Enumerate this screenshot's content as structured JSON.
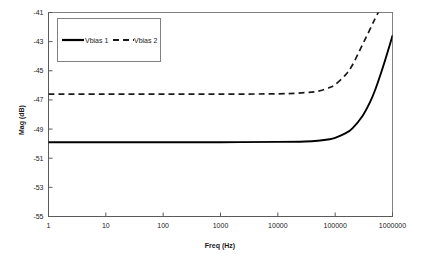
{
  "chart_data": {
    "type": "line",
    "title": "",
    "xlabel": "Freq (Hz)",
    "ylabel": "Mag (dB)",
    "xscale": "log",
    "xlim": [
      1,
      1000000
    ],
    "ylim": [
      -55,
      -41
    ],
    "grid": false,
    "legend_position": "top-left",
    "xticks": [
      "1",
      "10",
      "100",
      "1000",
      "10000",
      "100000",
      "1000000"
    ],
    "xtick_values": [
      1,
      10,
      100,
      1000,
      10000,
      100000,
      1000000
    ],
    "yticks": [
      "-41",
      "-43",
      "-45",
      "-47",
      "-49",
      "-51",
      "-53",
      "-55"
    ],
    "ytick_values": [
      -41,
      -43,
      -45,
      -47,
      -49,
      -51,
      -53,
      -55
    ],
    "series": [
      {
        "name": "Vbias 1",
        "style": "solid",
        "color": "#000000",
        "x": [
          1,
          10,
          100,
          1000,
          10000,
          30000,
          50000,
          80000,
          100000,
          150000,
          200000,
          300000,
          400000,
          500000,
          700000,
          1000000
        ],
        "values": [
          -49.9,
          -49.9,
          -49.9,
          -49.9,
          -49.88,
          -49.85,
          -49.8,
          -49.7,
          -49.6,
          -49.3,
          -48.95,
          -48.1,
          -47.2,
          -46.3,
          -44.6,
          -42.6
        ]
      },
      {
        "name": "Vbias 2",
        "style": "dashed",
        "color": "#1a1a1a",
        "x": [
          1,
          10,
          100,
          1000,
          10000,
          30000,
          50000,
          80000,
          100000,
          150000,
          200000,
          300000,
          400000,
          500000,
          600000,
          700000
        ],
        "values": [
          -46.6,
          -46.6,
          -46.6,
          -46.6,
          -46.58,
          -46.5,
          -46.4,
          -46.15,
          -45.95,
          -45.3,
          -44.6,
          -43.2,
          -42.2,
          -41.4,
          -40.8,
          -40.3
        ]
      }
    ]
  },
  "legend": {
    "items": [
      {
        "label": "Vbias 1"
      },
      {
        "label": "Vbias 2"
      }
    ]
  }
}
